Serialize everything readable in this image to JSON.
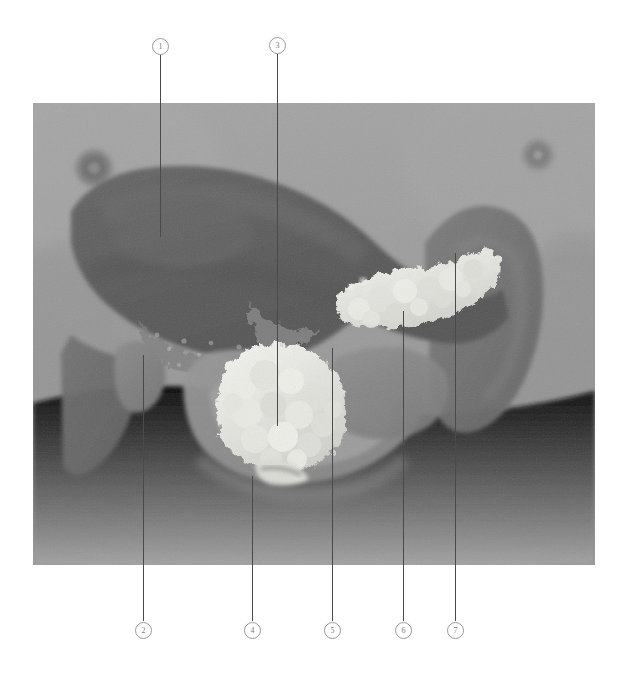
{
  "figure": {
    "modality": "grayscale anatomical rendering",
    "plate": {
      "left": 33,
      "top": 103,
      "width": 562,
      "height": 462,
      "background_color": "#9a9a9a"
    },
    "line_color": "#4a4a4a",
    "callout_border_color": "#9a9a9a",
    "callout_text_color": "#7a7a7a"
  },
  "callouts": [
    {
      "id": "callout-1",
      "label": "1",
      "marker": {
        "cx": 160,
        "cy": 46
      },
      "leader": {
        "x": 160,
        "y_top": 55,
        "y_bottom": 237
      },
      "position": "top"
    },
    {
      "id": "callout-3",
      "label": "3",
      "marker": {
        "cx": 277,
        "cy": 45
      },
      "leader": {
        "x": 277,
        "y_top": 54,
        "y_bottom": 426
      },
      "position": "top"
    },
    {
      "id": "callout-2",
      "label": "2",
      "marker": {
        "cx": 143,
        "cy": 630
      },
      "leader": {
        "x": 143,
        "y_top": 355,
        "y_bottom": 621
      },
      "position": "bottom"
    },
    {
      "id": "callout-4",
      "label": "4",
      "marker": {
        "cx": 252,
        "cy": 630
      },
      "leader": {
        "x": 252,
        "y_top": 476,
        "y_bottom": 621
      },
      "position": "bottom"
    },
    {
      "id": "callout-5",
      "label": "5",
      "marker": {
        "cx": 332,
        "cy": 630
      },
      "leader": {
        "x": 332,
        "y_top": 348,
        "y_bottom": 621
      },
      "position": "bottom"
    },
    {
      "id": "callout-6",
      "label": "6",
      "marker": {
        "cx": 403,
        "cy": 630
      },
      "leader": {
        "x": 403,
        "y_top": 311,
        "y_bottom": 621
      },
      "position": "bottom"
    },
    {
      "id": "callout-7",
      "label": "7",
      "marker": {
        "cx": 455,
        "cy": 630
      },
      "leader": {
        "x": 455,
        "y_top": 253,
        "y_bottom": 621
      },
      "position": "bottom"
    }
  ],
  "anatomy": {
    "regions": [
      {
        "name": "body-wall-background",
        "tone": "#9a9a9a"
      },
      {
        "name": "left-nipple",
        "cx": 94,
        "cy": 168,
        "tone": "#6d6d6d"
      },
      {
        "name": "right-nipple",
        "cx": 538,
        "cy": 155,
        "tone": "#767676"
      },
      {
        "name": "liver-mass",
        "tone": "#5d5d5d"
      },
      {
        "name": "liver-lower-lobe",
        "tone": "#6a6a6a"
      },
      {
        "name": "gallbladder",
        "tone": "#7e7e7e"
      },
      {
        "name": "pancreas-head",
        "tone": "#e8e8e4"
      },
      {
        "name": "pancreas-body-tail",
        "tone": "#d5d5d0"
      },
      {
        "name": "duodenum-loop",
        "tone": "#8e8e8e"
      },
      {
        "name": "stomach",
        "tone": "#848484"
      },
      {
        "name": "spleen",
        "tone": "#6f6f6f"
      },
      {
        "name": "bowel-field",
        "tone": "#a6a6a6"
      }
    ]
  }
}
